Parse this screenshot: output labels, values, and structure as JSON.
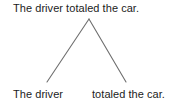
{
  "diagram": {
    "type": "syntax-parse-tree",
    "background_color": "#ffffff",
    "text_color": "#1c1c1c",
    "branch_color": "#6e6e6e",
    "root": {
      "label": "The driver totaled the car."
    },
    "children": [
      {
        "label": "The driver",
        "role": "subject"
      },
      {
        "label": "totaled the car.",
        "role": "predicate"
      }
    ],
    "branches": [
      {
        "name": "left-branch",
        "from_x": 89,
        "from_y": 19,
        "to_x": 47,
        "to_y": 82
      },
      {
        "name": "right-branch",
        "from_x": 89,
        "from_y": 19,
        "to_x": 126,
        "to_y": 82
      }
    ]
  }
}
